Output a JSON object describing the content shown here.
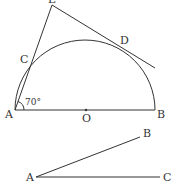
{
  "figure1": {
    "labels": {
      "E": "E",
      "C": "C",
      "D": "D",
      "A": "A",
      "O": "O",
      "B": "B"
    },
    "angle_label": "70°"
  },
  "figure2": {
    "labels": {
      "A": "A",
      "B": "B",
      "C": "C"
    }
  },
  "colors": {
    "stroke": "#333333",
    "background": "#ffffff"
  }
}
